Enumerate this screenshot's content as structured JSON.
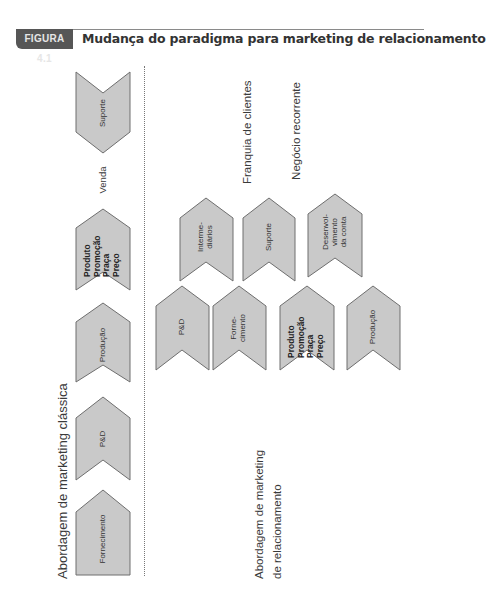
{
  "header": {
    "badge": "FIGURA 4.1",
    "title": "Mudança do paradigma para marketing de relacionamento"
  },
  "colors": {
    "badge_bg": "#565656",
    "chevron_fill": "#c9c9c9",
    "chevron_stroke": "#6e6e6e",
    "text": "#333333"
  },
  "classic": {
    "label": "Abordagem de marketing clássica",
    "between_label": "Venda",
    "chevrons": [
      {
        "id": "fornecimento",
        "text": "Fornecimento",
        "bold": false
      },
      {
        "id": "pd",
        "text": "P&D",
        "bold": false
      },
      {
        "id": "producao",
        "text": "Produção",
        "bold": false
      },
      {
        "id": "4ps",
        "text": "Produto\nPromoção\nPraça\nPreço",
        "bold": true
      },
      {
        "id": "suporte",
        "text": "Suporte",
        "bold": false
      }
    ]
  },
  "relationship": {
    "label_line1": "Abordagem de marketing",
    "label_line2": "de relacionamento",
    "outcome1": "Franquia de clientes",
    "outcome2": "Negócio recorrente",
    "bottom_row": [
      {
        "id": "pd",
        "text": "P&D",
        "bold": false
      },
      {
        "id": "fornecimento",
        "text": "Forne-\ncimento",
        "bold": false
      },
      {
        "id": "4ps",
        "text": "Produto\nPromoção\nPraça\nPreço",
        "bold": true
      },
      {
        "id": "producao",
        "text": "Produção",
        "bold": false
      }
    ],
    "top_row": [
      {
        "id": "intermediarios",
        "text": "Interme-\ndiários",
        "bold": false
      },
      {
        "id": "suporte",
        "text": "Suporte",
        "bold": false
      },
      {
        "id": "desenvolvimento",
        "text": "Desenvol-\nvimento\nda conta",
        "bold": false
      }
    ]
  }
}
